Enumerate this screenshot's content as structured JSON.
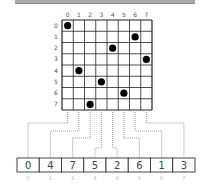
{
  "diagram": {
    "board_size": 8,
    "column_labels": [
      "0",
      "1",
      "2",
      "3",
      "4",
      "5",
      "6",
      "7"
    ],
    "row_labels": [
      "0",
      "1",
      "2",
      "3",
      "4",
      "5",
      "6",
      "7"
    ],
    "queens": [
      {
        "row": 0,
        "col": 0
      },
      {
        "row": 1,
        "col": 6
      },
      {
        "row": 2,
        "col": 4
      },
      {
        "row": 3,
        "col": 7
      },
      {
        "row": 4,
        "col": 1
      },
      {
        "row": 5,
        "col": 3
      },
      {
        "row": 6,
        "col": 5
      },
      {
        "row": 7,
        "col": 2
      }
    ],
    "array_values": [
      "0",
      "4",
      "7",
      "5",
      "2",
      "6",
      "1",
      "3"
    ],
    "array_indices": [
      "0",
      "1",
      "2",
      "3",
      "4",
      "5",
      "6",
      "7"
    ],
    "colors": {
      "grid_line": "#222222",
      "queen": "#000000",
      "connector": "#999999",
      "array_border": "#333333",
      "index_text": "#b8b8b8"
    }
  }
}
